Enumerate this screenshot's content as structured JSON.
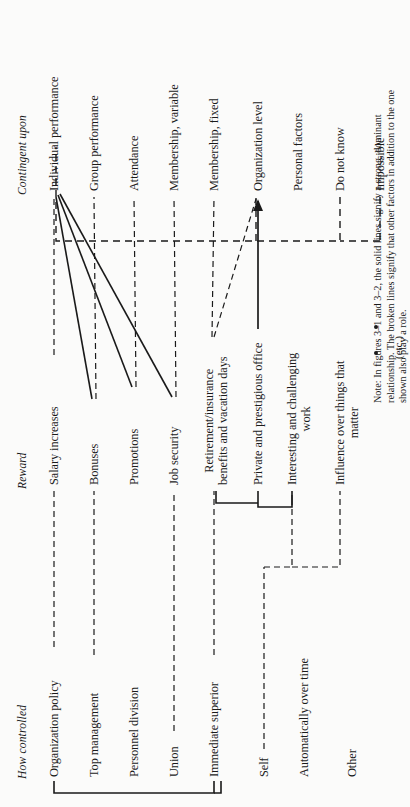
{
  "figure": {
    "orientation": "rotated-90-ccw",
    "ink_color": "#1a1a1a",
    "paper_color": "#fbfbfa"
  },
  "columns": {
    "how_controlled": "How controlled",
    "reward": "Reward",
    "contingent_upon": "Contingent upon"
  },
  "how_controlled_items": [
    {
      "label": "Organization policy"
    },
    {
      "label": "Top management"
    },
    {
      "label": "Personnel division"
    },
    {
      "label": "Union"
    },
    {
      "label": "Immediate superior"
    },
    {
      "label": "Self"
    },
    {
      "label": "Automatically over time"
    },
    {
      "label": "Other"
    }
  ],
  "reward_items": [
    {
      "label": "Salary increases"
    },
    {
      "label": "Bonuses"
    },
    {
      "label": "Promotions"
    },
    {
      "label": "Job security"
    },
    {
      "label": "Retirement/insurance\nbenefits and vacation days"
    },
    {
      "label": "Private and prestigious office"
    },
    {
      "label": "Interesting and challenging\nwork"
    },
    {
      "label": "Influence over things that\nmatter"
    }
  ],
  "contingent_items": [
    {
      "label": "Individual performance"
    },
    {
      "label": "Group performance"
    },
    {
      "label": "Attendance"
    },
    {
      "label": "Membership, variable"
    },
    {
      "label": "Membership, fixed"
    },
    {
      "label": "Organization level"
    },
    {
      "label": "Personal factors"
    },
    {
      "label": "Do not know"
    },
    {
      "label": "Impossible"
    }
  ],
  "continuation": {
    "dots": 2,
    "etc_label": "(etc.)"
  },
  "note": "Note: In figures 3–1 and 3–2, the solid lines signify a strong, dominant relationship. The broken lines signify that other factors in addition to the one shown also play a role."
}
